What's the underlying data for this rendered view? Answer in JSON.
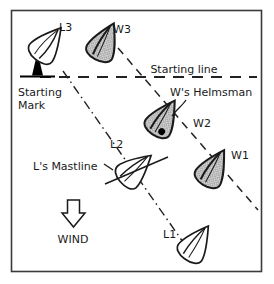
{
  "diagram": {
    "title_text": "",
    "frame": {
      "border_color": "#3a3a3a",
      "fill_color": "#ffffff",
      "x": 11,
      "y": 10,
      "width": 251,
      "height": 262
    },
    "labels": {
      "l3": "L3",
      "w3": "W3",
      "starting_line": "Starting line",
      "starting_mark_line1": "Starting",
      "starting_mark_line2": "Mark",
      "ws_helmsman": "W's Helmsman",
      "w2": "W2",
      "l2": "L2",
      "w1": "W1",
      "ls_mastline": "L's Mastline",
      "wind": "WIND",
      "l1": "L1"
    },
    "colors": {
      "ink": "#1a1a1a",
      "windward_hull_fill": "#c9c9c9",
      "leeward_hull_fill": "#ffffff",
      "mark_fill": "#000000",
      "line": "#222222"
    },
    "boats": [
      {
        "id": "L3",
        "type": "leeward",
        "fill": "white",
        "label": "L3"
      },
      {
        "id": "W3",
        "type": "windward",
        "fill": "hatched-gray",
        "label": "W3"
      },
      {
        "id": "W2",
        "type": "windward",
        "fill": "hatched-gray",
        "label": "W2",
        "has_helmsman_dot": true
      },
      {
        "id": "L2",
        "type": "leeward",
        "fill": "white",
        "label": "L2",
        "has_mastline": true
      },
      {
        "id": "W1",
        "type": "windward",
        "fill": "hatched-gray",
        "label": "W1"
      },
      {
        "id": "L1",
        "type": "leeward",
        "fill": "white",
        "label": "L1"
      }
    ],
    "lines": {
      "starting_line_style": "dashed",
      "windward_track_style": "dashed",
      "leeward_track_style": "dash-dot"
    },
    "wind_arrow": {
      "direction": "down",
      "fill": "#ffffff",
      "stroke": "#1a1a1a"
    }
  }
}
